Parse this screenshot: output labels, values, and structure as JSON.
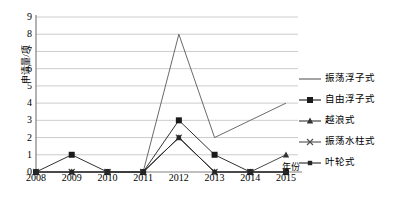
{
  "chart_data": {
    "type": "line",
    "title": "",
    "xlabel": "年份",
    "ylabel": "申请量/项",
    "categories": [
      "2008",
      "2009",
      "2010",
      "2011",
      "2012",
      "2013",
      "2014",
      "2015"
    ],
    "x": [
      2008,
      2009,
      2010,
      2011,
      2012,
      2013,
      2014,
      2015
    ],
    "ylim": [
      0,
      9
    ],
    "yticks": [
      0,
      1,
      2,
      3,
      4,
      5,
      6,
      7,
      8,
      9
    ],
    "ytick_labels": [
      "0",
      "1",
      "2",
      "3",
      "4",
      "5",
      "6",
      "7",
      "8",
      "9"
    ],
    "grid": "horizontal",
    "legend_position": "right",
    "series": [
      {
        "name": "振荡浮子式",
        "marker": "none",
        "color": "#595959",
        "values": [
          null,
          null,
          null,
          0,
          8,
          2,
          3,
          4
        ]
      },
      {
        "name": "自由浮子式",
        "marker": "square",
        "color": "#1a1a1a",
        "values": [
          0,
          1,
          0,
          0,
          3,
          1,
          0,
          0
        ]
      },
      {
        "name": "越浪式",
        "marker": "triangle",
        "color": "#333333",
        "values": [
          0,
          0,
          0,
          0,
          2,
          0,
          0,
          1
        ]
      },
      {
        "name": "振荡水柱式",
        "marker": "x",
        "color": "#4d4d4d",
        "values": [
          0,
          0,
          0,
          0,
          2,
          0,
          0,
          0
        ]
      },
      {
        "name": "叶轮式",
        "marker": "square-small",
        "color": "#262626",
        "values": [
          0,
          0,
          0,
          0,
          2,
          0,
          0,
          0
        ]
      }
    ]
  },
  "legend": {
    "items": [
      {
        "label": "振荡浮子式"
      },
      {
        "label": "自由浮子式"
      },
      {
        "label": "越浪式"
      },
      {
        "label": "振荡水柱式"
      },
      {
        "label": "叶轮式"
      }
    ]
  },
  "axes": {
    "y_title": "申请量/项",
    "x_title": "年份"
  },
  "colors": {
    "axis": "#808080",
    "grid": "#bfbfbf",
    "text": "#000000",
    "plot_background": "#ffffff"
  }
}
